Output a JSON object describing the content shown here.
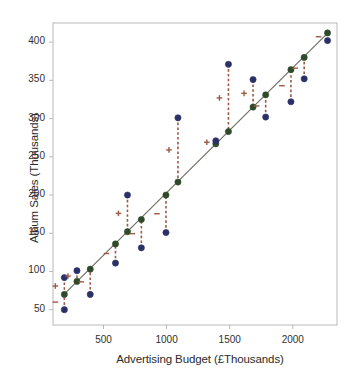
{
  "chart_data": {
    "type": "scatter",
    "title": "",
    "xlabel": "Advertising Budget (£Thousands)",
    "ylabel": "Album Sales (Thousands)",
    "xlim": [
      100,
      2350
    ],
    "ylim": [
      30,
      425
    ],
    "xticks": [
      500,
      1000,
      1500,
      2000
    ],
    "xticklabels": [
      "500",
      "1000",
      "1500",
      "2000"
    ],
    "yticks": [
      50,
      100,
      150,
      200,
      250,
      300,
      350,
      400
    ],
    "yticklabels": [
      "50",
      "100",
      "150",
      "200",
      "250",
      "300",
      "350",
      "400"
    ],
    "grid": false,
    "legend": null,
    "colors": {
      "observed": "#2b3166",
      "predicted": "#2f4a2a",
      "residual": "#9a5a44",
      "regression_line": "#6a6a60",
      "frame": "#b9b9b9",
      "text": "#2b2b2b"
    },
    "series": [
      {
        "name": "Observed (blue)",
        "marker": "circle",
        "color": "#2b3166",
        "points": [
          {
            "x": 190,
            "y": 50
          },
          {
            "x": 190,
            "y": 92
          },
          {
            "x": 290,
            "y": 101
          },
          {
            "x": 395,
            "y": 70
          },
          {
            "x": 595,
            "y": 111
          },
          {
            "x": 690,
            "y": 200
          },
          {
            "x": 800,
            "y": 131
          },
          {
            "x": 995,
            "y": 151
          },
          {
            "x": 1090,
            "y": 301
          },
          {
            "x": 1390,
            "y": 271
          },
          {
            "x": 1490,
            "y": 371
          },
          {
            "x": 1685,
            "y": 351
          },
          {
            "x": 1785,
            "y": 302
          },
          {
            "x": 1985,
            "y": 322
          },
          {
            "x": 2090,
            "y": 352
          },
          {
            "x": 2275,
            "y": 402
          }
        ]
      },
      {
        "name": "Predicted (green, on line)",
        "marker": "circle",
        "color": "#2f4a2a",
        "points": [
          {
            "x": 190,
            "y": 70
          },
          {
            "x": 290,
            "y": 87
          },
          {
            "x": 395,
            "y": 103
          },
          {
            "x": 595,
            "y": 136
          },
          {
            "x": 690,
            "y": 152
          },
          {
            "x": 800,
            "y": 168
          },
          {
            "x": 995,
            "y": 200
          },
          {
            "x": 1090,
            "y": 217
          },
          {
            "x": 1390,
            "y": 267
          },
          {
            "x": 1490,
            "y": 283
          },
          {
            "x": 1685,
            "y": 315
          },
          {
            "x": 1785,
            "y": 331
          },
          {
            "x": 1985,
            "y": 364
          },
          {
            "x": 2090,
            "y": 380
          },
          {
            "x": 2275,
            "y": 412
          }
        ]
      }
    ],
    "regression_line": {
      "name": "Fitted regression line",
      "color": "#6a6a60",
      "x_start": 175,
      "y_start": 68,
      "x_end": 2290,
      "y_end": 414
    },
    "residual_segments": [
      {
        "x": 190,
        "y_obs": 50,
        "y_fit": 70,
        "sign": "-"
      },
      {
        "x": 190,
        "y_obs": 92,
        "y_fit": 70,
        "sign": "+"
      },
      {
        "x": 290,
        "y_obs": 101,
        "y_fit": 87,
        "sign": "+"
      },
      {
        "x": 395,
        "y_obs": 70,
        "y_fit": 103,
        "sign": "-"
      },
      {
        "x": 595,
        "y_obs": 111,
        "y_fit": 136,
        "sign": "-"
      },
      {
        "x": 690,
        "y_obs": 200,
        "y_fit": 152,
        "sign": "+"
      },
      {
        "x": 800,
        "y_obs": 131,
        "y_fit": 168,
        "sign": "-"
      },
      {
        "x": 995,
        "y_obs": 151,
        "y_fit": 200,
        "sign": "-"
      },
      {
        "x": 1090,
        "y_obs": 301,
        "y_fit": 217,
        "sign": "+"
      },
      {
        "x": 1390,
        "y_obs": 271,
        "y_fit": 267,
        "sign": "+"
      },
      {
        "x": 1490,
        "y_obs": 371,
        "y_fit": 283,
        "sign": "+"
      },
      {
        "x": 1685,
        "y_obs": 351,
        "y_fit": 315,
        "sign": "+"
      },
      {
        "x": 1785,
        "y_obs": 302,
        "y_fit": 331,
        "sign": "-"
      },
      {
        "x": 1985,
        "y_obs": 322,
        "y_fit": 364,
        "sign": "-"
      },
      {
        "x": 2090,
        "y_obs": 352,
        "y_fit": 380,
        "sign": "-"
      },
      {
        "x": 2275,
        "y_obs": 402,
        "y_fit": 412,
        "sign": "-"
      }
    ]
  },
  "axes": {
    "xlabel": "Advertising Budget (£Thousands)",
    "ylabel": "Album Sales (Thousands)"
  }
}
